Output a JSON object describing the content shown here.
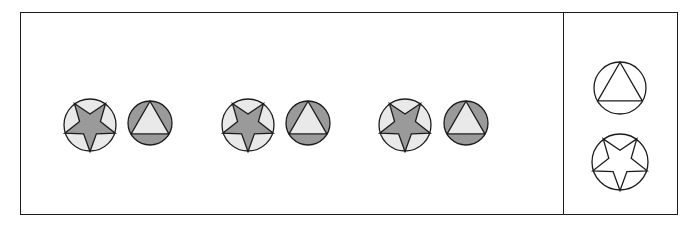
{
  "puzzle": {
    "kind": "visual-analogy-sequence",
    "title": "Shape sequence pattern",
    "frame": {
      "border_color": "#1c1c1c",
      "background_color": "#ffffff",
      "x": 20,
      "y": 12,
      "width": 658,
      "height": 203
    },
    "divider": {
      "x": 563,
      "y": 12,
      "height": 203,
      "color": "#1c1c1c"
    }
  },
  "palette": {
    "light_gray": "#e9e9e9",
    "medium_gray": "#9a9a9a",
    "outline": "#1c1c1c",
    "white": "#ffffff"
  },
  "sequence": {
    "label": "Repeating pair pattern, three repetitions",
    "repetitions": 3,
    "items": [
      {
        "index": 1,
        "name": "star-in-circle-light",
        "shape": "star",
        "star_orientation": "point-down",
        "circle_fill": "#e9e9e9",
        "inner_fill": "#9a9a9a",
        "circle_radius": 26,
        "cx": 90,
        "cy": 125
      },
      {
        "index": 2,
        "name": "triangle-in-circle-dark",
        "shape": "triangle",
        "triangle_orientation": "point-up",
        "circle_fill": "#9a9a9a",
        "inner_fill": "#e9e9e9",
        "circle_radius": 22,
        "cx": 150,
        "cy": 123
      },
      {
        "index": 3,
        "name": "star-in-circle-light",
        "shape": "star",
        "star_orientation": "point-down",
        "circle_fill": "#e9e9e9",
        "inner_fill": "#9a9a9a",
        "circle_radius": 26,
        "cx": 248,
        "cy": 125
      },
      {
        "index": 4,
        "name": "triangle-in-circle-dark",
        "shape": "triangle",
        "triangle_orientation": "point-up",
        "circle_fill": "#9a9a9a",
        "inner_fill": "#e9e9e9",
        "circle_radius": 22,
        "cx": 308,
        "cy": 123
      },
      {
        "index": 5,
        "name": "star-in-circle-light",
        "shape": "star",
        "star_orientation": "point-down",
        "circle_fill": "#e9e9e9",
        "inner_fill": "#9a9a9a",
        "circle_radius": 26,
        "cx": 405,
        "cy": 125
      },
      {
        "index": 6,
        "name": "triangle-in-circle-dark",
        "shape": "triangle",
        "triangle_orientation": "point-up",
        "circle_fill": "#9a9a9a",
        "inner_fill": "#e9e9e9",
        "circle_radius": 22,
        "cx": 466,
        "cy": 123
      }
    ]
  },
  "options": {
    "label": "Answer choices",
    "count": 2,
    "items": [
      {
        "index": 1,
        "name": "option-triangle-in-circle-outline",
        "shape": "triangle",
        "triangle_orientation": "point-up",
        "circle_fill": "#ffffff",
        "inner_fill": "#ffffff",
        "outline": "#1c1c1c",
        "circle_radius": 26,
        "cx": 620,
        "cy": 88
      },
      {
        "index": 2,
        "name": "option-star-in-circle-outline",
        "shape": "star",
        "star_orientation": "point-down",
        "circle_fill": "#ffffff",
        "inner_fill": "#ffffff",
        "outline": "#1c1c1c",
        "circle_radius": 28,
        "cx": 620,
        "cy": 162
      }
    ]
  }
}
